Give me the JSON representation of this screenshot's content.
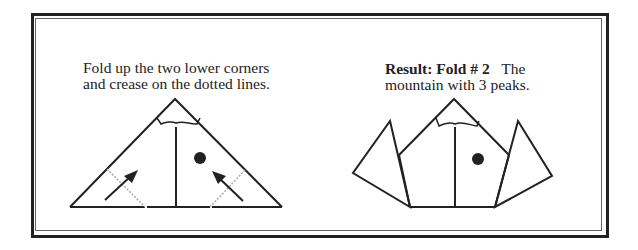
{
  "step_left": {
    "caption_line1": "Fold up the two lower corners",
    "caption_line2": "and crease on the dotted lines."
  },
  "step_right": {
    "caption_bold": "Result: Fold # 2",
    "caption_rest": "The",
    "caption_line2": "mountain with 3 peaks."
  },
  "colors": {
    "line": "#222222",
    "dotted": "#999999",
    "border": "#222222"
  }
}
